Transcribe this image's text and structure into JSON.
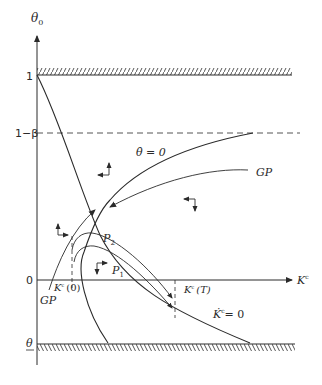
{
  "diagram": {
    "type": "phase-diagram",
    "axes": {
      "y_label": "θ",
      "y_label_sub": "0",
      "x_label": "K",
      "x_label_sup": "c"
    },
    "y_ticks": {
      "one": "1",
      "one_minus_beta": "1−β",
      "zero": "0",
      "theta_lower": "θ"
    },
    "x_ticks": {
      "k_initial": "K",
      "k_initial_sup": "c",
      "k_initial_arg": "(0)",
      "k_terminal": "K",
      "k_terminal_sup": "c",
      "k_terminal_arg": "(T)"
    },
    "curves": {
      "theta_dot_zero": "θ̇ = 0",
      "k_dot_zero_k": "K̇",
      "k_dot_zero_sup": "c",
      "k_dot_zero_eq": "= 0",
      "gp_upper": "GP",
      "gp_lower": "GP"
    },
    "points": {
      "p1": "P",
      "p1_sub": "1",
      "p2": "P",
      "p2_sub": "2"
    },
    "boundaries": {
      "upper": "hatched bound θ₀ = 1",
      "lower": "hatched bound θ₀ = θ"
    },
    "direction_arrows": [
      {
        "region": "upper-left",
        "directions": [
          "left",
          "up"
        ]
      },
      {
        "region": "upper-right",
        "directions": [
          "left",
          "down"
        ]
      },
      {
        "region": "lower-left",
        "directions": [
          "up",
          "right"
        ]
      },
      {
        "region": "lower-middle",
        "directions": [
          "right",
          "down"
        ]
      }
    ],
    "colors": {
      "line": "#2a2a2a",
      "background": "#ffffff"
    }
  }
}
